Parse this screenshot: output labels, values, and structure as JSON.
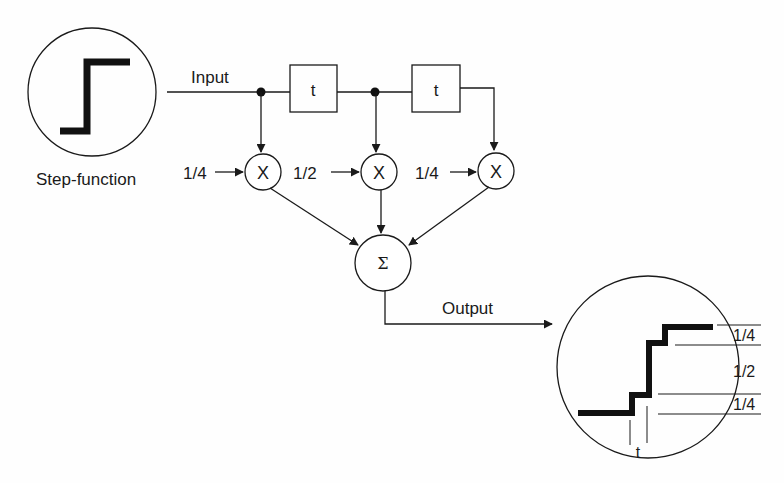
{
  "diagram": {
    "colors": {
      "stroke": "#1a1a1a",
      "background": "#fefefe"
    },
    "input": {
      "label": "Input",
      "source_label": "Step-function"
    },
    "delays": [
      {
        "label": "t"
      },
      {
        "label": "t"
      }
    ],
    "multipliers": [
      {
        "symbol": "X",
        "coefficient": "1/4"
      },
      {
        "symbol": "X",
        "coefficient": "1/2"
      },
      {
        "symbol": "X",
        "coefficient": "1/4"
      }
    ],
    "summer": {
      "symbol": "Σ"
    },
    "output": {
      "label": "Output",
      "step_labels": [
        "1/4",
        "1/2",
        "1/4"
      ],
      "time_label": "t"
    }
  }
}
